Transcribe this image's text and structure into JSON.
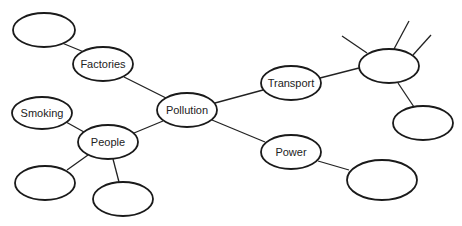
{
  "diagram": {
    "type": "mind-map",
    "center": "Pollution",
    "nodes": [
      {
        "id": "pollution",
        "label": "Pollution",
        "cx": 187,
        "cy": 110,
        "rx": 30,
        "ry": 17
      },
      {
        "id": "factories",
        "label": "Factories",
        "cx": 103,
        "cy": 64,
        "rx": 30,
        "ry": 17
      },
      {
        "id": "factories-child",
        "label": "",
        "cx": 44,
        "cy": 30,
        "rx": 31,
        "ry": 17
      },
      {
        "id": "people",
        "label": "People",
        "cx": 108,
        "cy": 142,
        "rx": 30,
        "ry": 17
      },
      {
        "id": "smoking",
        "label": "Smoking",
        "cx": 42,
        "cy": 113,
        "rx": 30,
        "ry": 16
      },
      {
        "id": "people-child-1",
        "label": "",
        "cx": 45,
        "cy": 183,
        "rx": 30,
        "ry": 17
      },
      {
        "id": "people-child-2",
        "label": "",
        "cx": 123,
        "cy": 199,
        "rx": 30,
        "ry": 17
      },
      {
        "id": "transport",
        "label": "Transport",
        "cx": 291,
        "cy": 83,
        "rx": 30,
        "ry": 17
      },
      {
        "id": "transport-child",
        "label": "",
        "cx": 389,
        "cy": 66,
        "rx": 30,
        "ry": 17
      },
      {
        "id": "transport-grandchild",
        "label": "",
        "cx": 423,
        "cy": 123,
        "rx": 30,
        "ry": 17
      },
      {
        "id": "power",
        "label": "Power",
        "cx": 291,
        "cy": 152,
        "rx": 30,
        "ry": 17
      },
      {
        "id": "power-child",
        "label": "",
        "cx": 382,
        "cy": 180,
        "rx": 35,
        "ry": 20
      }
    ],
    "edges": [
      {
        "from": "factories-child",
        "to": "factories",
        "x1": 62,
        "y1": 43,
        "x2": 84,
        "y2": 52
      },
      {
        "from": "factories",
        "to": "pollution",
        "x1": 124,
        "y1": 77,
        "x2": 166,
        "y2": 98
      },
      {
        "from": "smoking",
        "to": "people",
        "x1": 66,
        "y1": 122,
        "x2": 84,
        "y2": 132
      },
      {
        "from": "people",
        "to": "pollution",
        "x1": 134,
        "y1": 133,
        "x2": 163,
        "y2": 121
      },
      {
        "from": "people",
        "to": "people-child-1",
        "x1": 88,
        "y1": 155,
        "x2": 67,
        "y2": 170
      },
      {
        "from": "people",
        "to": "people-child-2",
        "x1": 113,
        "y1": 159,
        "x2": 119,
        "y2": 182
      },
      {
        "from": "pollution",
        "to": "transport",
        "x1": 215,
        "y1": 103,
        "x2": 263,
        "y2": 90
      },
      {
        "from": "transport",
        "to": "transport-child",
        "x1": 320,
        "y1": 78,
        "x2": 359,
        "y2": 68
      },
      {
        "from": "transport-child",
        "to": "spoke-1",
        "x1": 367,
        "y1": 53,
        "x2": 342,
        "y2": 36
      },
      {
        "from": "transport-child",
        "to": "spoke-2",
        "x1": 394,
        "y1": 49,
        "x2": 409,
        "y2": 21
      },
      {
        "from": "transport-child",
        "to": "spoke-3",
        "x1": 413,
        "y1": 55,
        "x2": 431,
        "y2": 35
      },
      {
        "from": "transport-child",
        "to": "transport-grandchild",
        "x1": 398,
        "y1": 83,
        "x2": 414,
        "y2": 107
      },
      {
        "from": "pollution",
        "to": "power",
        "x1": 212,
        "y1": 120,
        "x2": 265,
        "y2": 142
      },
      {
        "from": "power",
        "to": "power-child",
        "x1": 318,
        "y1": 161,
        "x2": 349,
        "y2": 170
      }
    ]
  }
}
